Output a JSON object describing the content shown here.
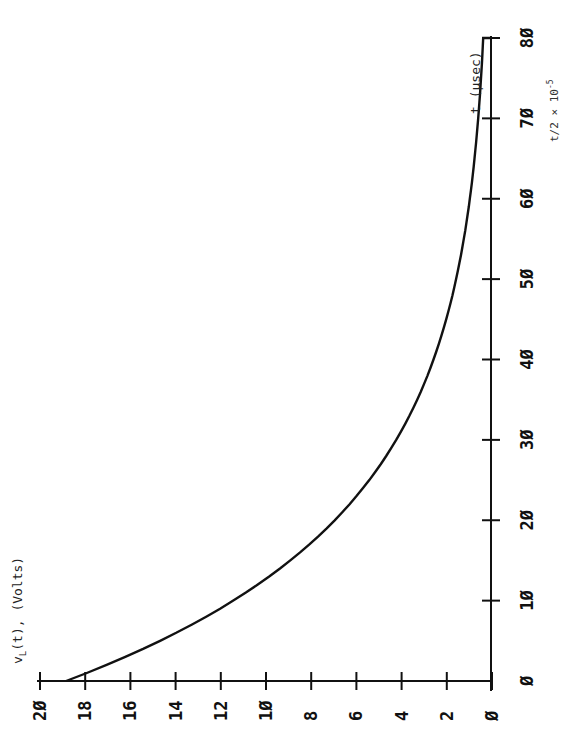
{
  "chart_data": {
    "type": "line",
    "orientation": "rotated 90° clockwise (time axis runs vertically upward along right side, voltage axis runs horizontally along bottom with 20 at left and 0 at right)",
    "title": "",
    "xlabel": "t (µsec)",
    "ylabel": "v_L(t), (Volts)",
    "xlim": [
      0,
      80
    ],
    "ylim": [
      0,
      20
    ],
    "x_ticks": [
      "Ø",
      "1Ø",
      "2Ø",
      "3Ø",
      "4Ø",
      "5Ø",
      "6Ø",
      "7Ø",
      "8Ø"
    ],
    "y_ticks": [
      "2Ø",
      "18",
      "16",
      "14",
      "12",
      "1Ø",
      "8",
      "6",
      "4",
      "2",
      "Ø"
    ],
    "grid": false,
    "legend": null,
    "annotation_partial": "t/2 × 10^-5",
    "series": [
      {
        "name": "v_L(t)",
        "x": [
          0,
          5,
          10,
          15,
          20,
          25,
          30,
          35,
          40,
          45,
          50,
          55,
          60,
          65,
          70,
          75,
          80
        ],
        "values": [
          18.8,
          14.6,
          11.4,
          8.9,
          6.9,
          5.4,
          4.2,
          3.3,
          2.5,
          2.0,
          1.5,
          1.2,
          0.9,
          0.7,
          0.6,
          0.4,
          0.3
        ]
      }
    ]
  },
  "labels": {
    "y_axis": "v",
    "y_axis_sub": "L",
    "y_axis_rest": "(t), (Volts)",
    "x_axis": "t (µsec)",
    "cut_annotation": "t/2 × 10",
    "cut_annotation_exp": "-5"
  }
}
